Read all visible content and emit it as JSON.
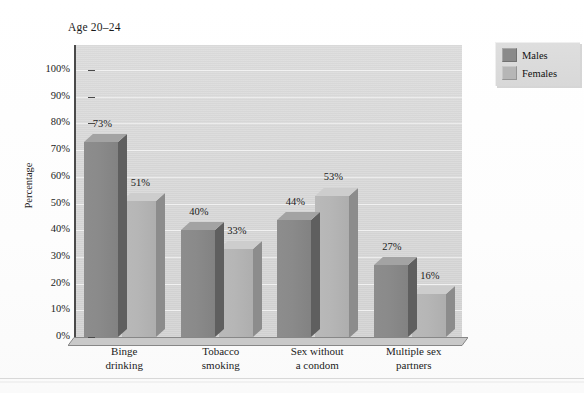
{
  "figure": {
    "title": "Age 20–24",
    "ylabel": "Percentage"
  },
  "legend": {
    "items": [
      {
        "label": "Males",
        "color": "#8a8a8a"
      },
      {
        "label": "Females",
        "color": "#b6b6b6"
      }
    ]
  },
  "axis": {
    "yticks": [
      "0%",
      "10%",
      "20%",
      "30%",
      "40%",
      "50%",
      "60%",
      "70%",
      "80%",
      "90%",
      "100%"
    ]
  },
  "categories": [
    {
      "line1": "Binge",
      "line2": "drinking"
    },
    {
      "line1": "Tobacco",
      "line2": "smoking"
    },
    {
      "line1": "Sex without",
      "line2": "a condom"
    },
    {
      "line1": "Multiple sex",
      "line2": "partners"
    }
  ],
  "bars": [
    {
      "category": "Binge drinking",
      "series": "Males",
      "value": 73,
      "label": "73%"
    },
    {
      "category": "Binge drinking",
      "series": "Females",
      "value": 51,
      "label": "51%"
    },
    {
      "category": "Tobacco smoking",
      "series": "Males",
      "value": 40,
      "label": "40%"
    },
    {
      "category": "Tobacco smoking",
      "series": "Females",
      "value": 33,
      "label": "33%"
    },
    {
      "category": "Sex without a condom",
      "series": "Males",
      "value": 44,
      "label": "44%"
    },
    {
      "category": "Sex without a condom",
      "series": "Females",
      "value": 53,
      "label": "53%"
    },
    {
      "category": "Multiple sex partners",
      "series": "Males",
      "value": 27,
      "label": "27%"
    },
    {
      "category": "Multiple sex partners",
      "series": "Females",
      "value": 16,
      "label": "16%"
    }
  ],
  "chart_data": {
    "type": "bar",
    "title": "Age 20–24",
    "xlabel": "",
    "ylabel": "Percentage",
    "ylim": [
      0,
      100
    ],
    "ytick_labels": [
      "0%",
      "10%",
      "20%",
      "30%",
      "40%",
      "50%",
      "60%",
      "70%",
      "80%",
      "90%",
      "100%"
    ],
    "grid": true,
    "grid_axis": "y",
    "legend_position": "top-right-outside",
    "style": "3d-grouped-bars",
    "categories": [
      "Binge drinking",
      "Tobacco smoking",
      "Sex without a condom",
      "Multiple sex partners"
    ],
    "series": [
      {
        "name": "Males",
        "color": "#8a8a8a",
        "values": [
          73,
          40,
          44,
          27
        ],
        "data_labels": [
          "73%",
          "40%",
          "44%",
          "27%"
        ]
      },
      {
        "name": "Females",
        "color": "#b6b6b6",
        "values": [
          51,
          33,
          53,
          16
        ],
        "data_labels": [
          "51%",
          "33%",
          "53%",
          "16%"
        ]
      }
    ]
  }
}
